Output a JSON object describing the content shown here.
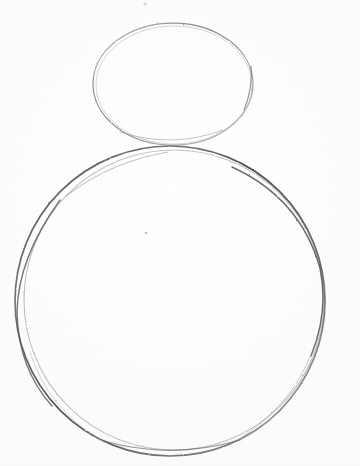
{
  "artwork": {
    "title": "Pencil construction sketch",
    "subject": "Two stacked shapes forming a snowman base drawing",
    "medium": "graphite pencil on white paper",
    "width": 360,
    "height": 466,
    "background_color": "#fdfdfd",
    "paper_tone": "#ffffff"
  },
  "shapes": {
    "head": {
      "name": "head ellipse",
      "type": "ellipse",
      "cx": 173,
      "cy": 84,
      "rx": 80,
      "ry": 61,
      "bounds": {
        "left": 93,
        "top": 23,
        "right": 253,
        "bottom": 145
      },
      "stroke_color": "#8d8d8d",
      "stroke_width": 1.25,
      "opacity": 0.85
    },
    "head_ghost": {
      "name": "head ellipse overdraw",
      "type": "ellipse",
      "cx": 174,
      "cy": 85,
      "rx": 78,
      "ry": 59,
      "stroke_color": "#b4b4b4",
      "stroke_width": 1,
      "opacity": 0.55
    },
    "body": {
      "name": "body circle",
      "type": "circle",
      "cx": 170,
      "cy": 301,
      "r": 155,
      "bounds": {
        "left": 15,
        "top": 146,
        "right": 325,
        "bottom": 456
      },
      "stroke_color": "#565656",
      "stroke_width": 1.7,
      "opacity": 0.92
    },
    "body_ghost": {
      "name": "body circle overdraw",
      "type": "circle",
      "cx": 174,
      "cy": 300,
      "r": 150,
      "stroke_color": "#9a9a9a",
      "stroke_width": 1.1,
      "opacity": 0.6
    }
  },
  "marks": [
    {
      "name": "stray mark top",
      "x": 145,
      "y": 4,
      "r": 1.6,
      "color": "#c9c9c9"
    },
    {
      "name": "stray mark center",
      "x": 146,
      "y": 233,
      "r": 1.3,
      "color": "#b6b6b6"
    }
  ],
  "labels": {
    "alt_text": "A light pencil sketch of a small ellipse above a large circle, the beginning of a snowman drawing."
  }
}
